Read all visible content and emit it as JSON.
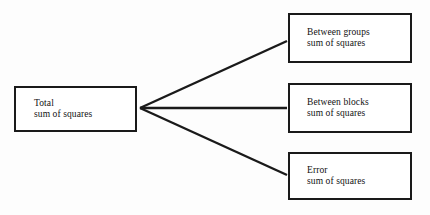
{
  "diagram": {
    "type": "tree",
    "background_color": "#fdfdfd",
    "stroke_color": "#1a1a1a",
    "text_color": "#111111",
    "source": {
      "id": "total",
      "line1": "Total",
      "line2": "sum of squares"
    },
    "branches": [
      {
        "id": "between-groups",
        "line1": "Between groups",
        "line2": "sum of squares"
      },
      {
        "id": "between-blocks",
        "line1": "Between blocks",
        "line2": "sum of squares"
      },
      {
        "id": "error",
        "line1": "Error",
        "line2": "sum of squares"
      }
    ],
    "connectors": [
      {
        "id": "total-to-between-groups",
        "from": "total",
        "to": "between-groups"
      },
      {
        "id": "total-to-between-blocks",
        "from": "total",
        "to": "between-blocks"
      },
      {
        "id": "total-to-error",
        "from": "total",
        "to": "error"
      }
    ]
  }
}
